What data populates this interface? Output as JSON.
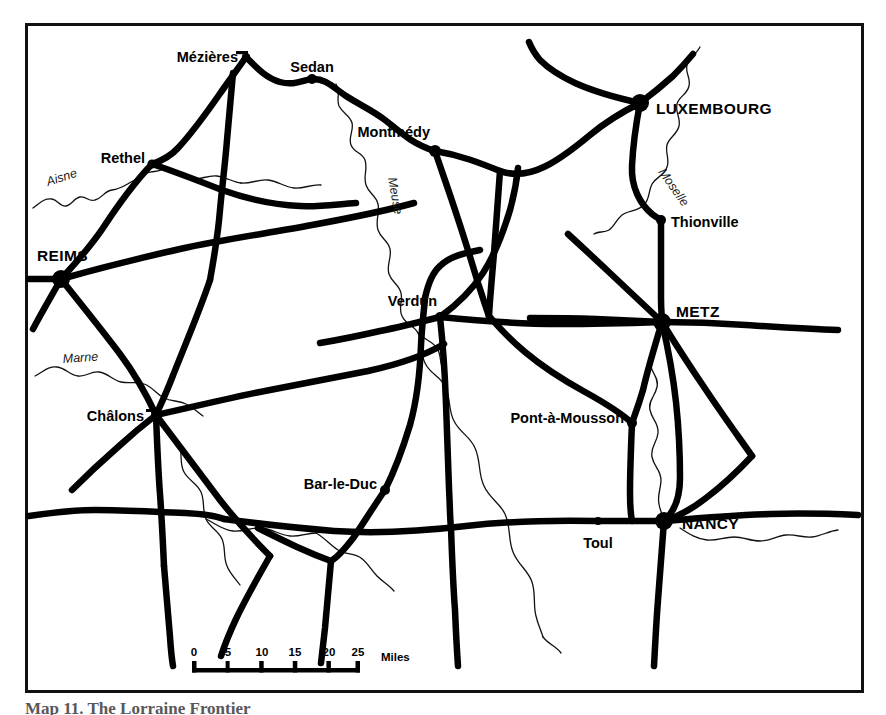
{
  "figure": {
    "type": "reference-map",
    "title_caption": "Map 11. The Lorraine Frontier",
    "background_color": "#ffffff",
    "ink_color": "#000000",
    "frame": {
      "x": 25,
      "y": 23,
      "width": 838,
      "height": 669,
      "stroke_width": 3
    }
  },
  "cities": [
    {
      "name": "Mézières",
      "rank": "minor",
      "dot_x": 246,
      "dot_y": 57,
      "label_x": 238,
      "label_y": 62,
      "anchor": "end",
      "marker": "bar"
    },
    {
      "name": "Sedan",
      "rank": "minor",
      "dot_x": 312,
      "dot_y": 79,
      "label_x": 312,
      "label_y": 72,
      "anchor": "middle",
      "marker": "dot"
    },
    {
      "name": "LUXEMBOURG",
      "rank": "major",
      "dot_x": 640,
      "dot_y": 103,
      "label_x": 656,
      "label_y": 114,
      "anchor": "start",
      "marker": "dot"
    },
    {
      "name": "Montmédy",
      "rank": "minor",
      "dot_x": 435,
      "dot_y": 151,
      "label_x": 430,
      "label_y": 137,
      "anchor": "end",
      "marker": "dot"
    },
    {
      "name": "Rethel",
      "rank": "minor",
      "dot_x": 152,
      "dot_y": 164,
      "label_x": 147,
      "label_y": 163,
      "anchor": "end",
      "marker": "dot"
    },
    {
      "name": "Thionville",
      "rank": "minor",
      "dot_x": 661,
      "dot_y": 220,
      "label_x": 670,
      "label_y": 227,
      "anchor": "start",
      "marker": "dot"
    },
    {
      "name": "REIMS",
      "rank": "major",
      "dot_x": 61,
      "dot_y": 279,
      "label_x": 88,
      "label_y": 261,
      "anchor": "end",
      "marker": "dot"
    },
    {
      "name": "Verdun",
      "rank": "minor",
      "dot_x": 440,
      "dot_y": 317,
      "label_x": 434,
      "label_y": 306,
      "anchor": "end",
      "marker": "dot"
    },
    {
      "name": "METZ",
      "rank": "major",
      "dot_x": 662,
      "dot_y": 322,
      "label_x": 676,
      "label_y": 317,
      "anchor": "start",
      "marker": "dot"
    },
    {
      "name": "Châlons",
      "rank": "minor",
      "dot_x": 156,
      "dot_y": 415,
      "label_x": 148,
      "label_y": 420,
      "anchor": "end",
      "marker": "bar"
    },
    {
      "name": "Pont-à-Mousson",
      "rank": "minor",
      "dot_x": 632,
      "dot_y": 423,
      "label_x": 624,
      "label_y": 423,
      "anchor": "end",
      "marker": "dot"
    },
    {
      "name": "Bar-le-Duc",
      "rank": "minor",
      "dot_x": 385,
      "dot_y": 490,
      "label_x": 377,
      "label_y": 488,
      "anchor": "end",
      "marker": "dot"
    },
    {
      "name": "NANCY",
      "rank": "major",
      "dot_x": 664,
      "dot_y": 521,
      "label_x": 682,
      "label_y": 529,
      "anchor": "start",
      "marker": "dot"
    },
    {
      "name": "Toul",
      "rank": "minor",
      "dot_x": 598,
      "dot_y": 521,
      "label_x": 598,
      "label_y": 547,
      "anchor": "middle",
      "marker": "dot"
    }
  ],
  "rivers": [
    {
      "name": "Aisne",
      "label_x": 48,
      "label_y": 186,
      "rotate": -18
    },
    {
      "name": "Meuse",
      "label_x": 388,
      "label_y": 178,
      "rotate": 80
    },
    {
      "name": "Moselle",
      "label_x": 664,
      "label_y": 176,
      "rotate": 72
    },
    {
      "name": "Marne",
      "label_x": 63,
      "label_y": 363,
      "rotate": -5
    }
  ],
  "scale_bar": {
    "unit": "Miles",
    "ticks": [
      "0",
      "5",
      "10",
      "15",
      "20",
      "25"
    ],
    "x_start": 192,
    "x_end": 360,
    "y_bar": 670,
    "y_label": 657,
    "unit_x": 381,
    "unit_y": 661
  }
}
